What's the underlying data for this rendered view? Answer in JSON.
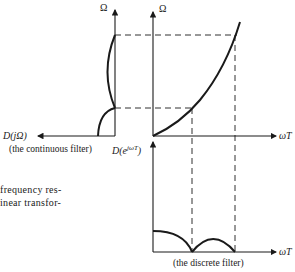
{
  "diagram": {
    "left_panel": {
      "y_axis_label": "Ω",
      "x_axis_label": "D(jΩ)",
      "caption": "(the continuous filter)"
    },
    "middle_panel": {
      "y_axis_label": "Ω",
      "x_axis_label": "ωT",
      "curve": "bilinear warping Ω vs ωT"
    },
    "bottom_panel": {
      "y_axis_label": "D(e^{jωT})",
      "y_axis_label_base": "D(e",
      "y_axis_label_sup": "jωT",
      "y_axis_label_close": ")",
      "x_axis_label": "ωT",
      "caption": "(the discrete filter)"
    },
    "body_text": {
      "line1": "frequency res-",
      "line2": "inear transfor-"
    },
    "colors": {
      "ink": "#1a1a1a",
      "background": "#ffffff"
    }
  }
}
